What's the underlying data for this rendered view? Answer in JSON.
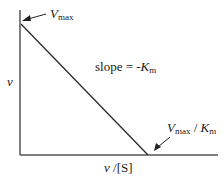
{
  "chart_data": {
    "type": "line",
    "title": "",
    "xlabel_parts": {
      "v": "v",
      "rest": " /[S]"
    },
    "ylabel": "v",
    "x_intercept_label": {
      "V": "V",
      "max": "max",
      "sep": " / ",
      "K": "K",
      "m": "m"
    },
    "y_intercept_label": {
      "V": "V",
      "max": "max"
    },
    "slope_label": {
      "text": "slope = -",
      "K": "K",
      "m": "m"
    },
    "series": [
      {
        "name": "Eadie-Hofstee line",
        "x": [
          0,
          1
        ],
        "y": [
          1,
          0
        ]
      }
    ],
    "xlim": [
      0,
      1.5
    ],
    "ylim": [
      0,
      1.1
    ],
    "grid": false,
    "colors": {
      "line": "#2a2a2a",
      "axis": "#555555",
      "text": "#1a1a1a"
    }
  }
}
